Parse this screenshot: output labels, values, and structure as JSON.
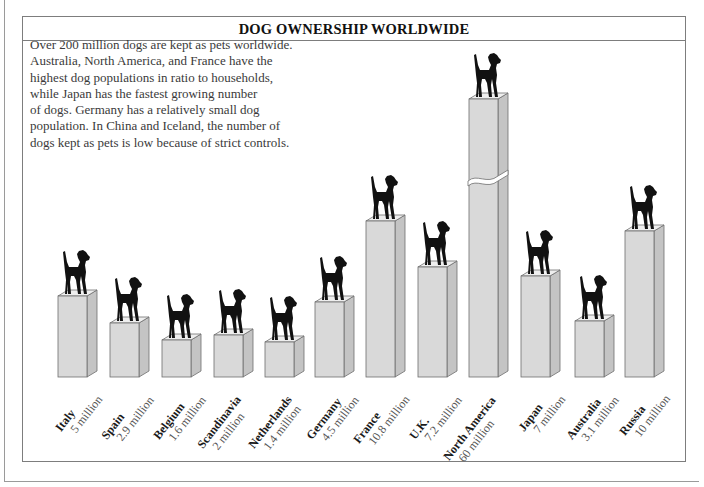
{
  "title": "DOG OWNERSHIP WORLDWIDE",
  "intro_lines": [
    "Over 200 million dogs are kept as pets worldwide.",
    "Australia, North America, and France have the",
    "highest dog populations in ratio to households,",
    "while Japan has the fastest growing number",
    "of dogs. Germany has a relatively small dog",
    "population. In China and Iceland, the number of",
    "dogs kept as pets is low because of strict controls."
  ],
  "colors": {
    "bar_front": "#d9d9d9",
    "bar_side": "#c4c4c4",
    "bar_top": "#eeeeee",
    "bar_stroke": "#6e6e6e",
    "dog": "#111111"
  },
  "chart_data": {
    "type": "bar",
    "title": "DOG OWNERSHIP WORLDWIDE",
    "xlabel": "",
    "ylabel": "Number of pet dogs",
    "unit": "million",
    "categories": [
      "Italy",
      "Spain",
      "Belgium",
      "Scandinavia",
      "Netherlands",
      "Germany",
      "France",
      "U.K.",
      "North America",
      "Japan",
      "Australia",
      "Russia"
    ],
    "values": [
      5,
      2.9,
      1.6,
      2,
      1.4,
      4.5,
      10.8,
      7.2,
      60,
      7,
      3.1,
      10
    ],
    "value_labels": [
      "5 million",
      "2.9 million",
      "1.6 million",
      "2 million",
      "1.4 million",
      "4.5 million",
      "10.8 million",
      "7.2 million",
      "60 million",
      "7 million",
      "3.1 million",
      "10 million"
    ],
    "broken_axis_bars": [
      "North America"
    ],
    "style": "3D pictorial bars topped with dog silhouettes",
    "grid": false,
    "legend": null
  },
  "bars": [
    {
      "country": "Italy",
      "value_label": "5 million",
      "x": 58,
      "top": 296,
      "height": 81
    },
    {
      "country": "Spain",
      "value_label": "2.9 million",
      "x": 110,
      "top": 323,
      "height": 54
    },
    {
      "country": "Belgium",
      "value_label": "1.6 million",
      "x": 162,
      "top": 340,
      "height": 37
    },
    {
      "country": "Scandinavia",
      "value_label": "2 million",
      "x": 214,
      "top": 335,
      "height": 42
    },
    {
      "country": "Netherlands",
      "value_label": "1.4 million",
      "x": 265,
      "top": 342,
      "height": 35
    },
    {
      "country": "Germany",
      "value_label": "4.5 million",
      "x": 315,
      "top": 302,
      "height": 75
    },
    {
      "country": "France",
      "value_label": "10.8 million",
      "x": 366,
      "top": 221,
      "height": 156
    },
    {
      "country": "U.K.",
      "value_label": "7.2 million",
      "x": 418,
      "top": 267,
      "height": 110
    },
    {
      "country": "North America",
      "value_label": "60 million",
      "x": 469,
      "top": 99,
      "height": 278,
      "broken": true
    },
    {
      "country": "Japan",
      "value_label": "7 million",
      "x": 521,
      "top": 276,
      "height": 101
    },
    {
      "country": "Australia",
      "value_label": "3.1 million",
      "x": 575,
      "top": 321,
      "height": 56
    },
    {
      "country": "Russia",
      "value_label": "10 million",
      "x": 625,
      "top": 231,
      "height": 146
    }
  ]
}
